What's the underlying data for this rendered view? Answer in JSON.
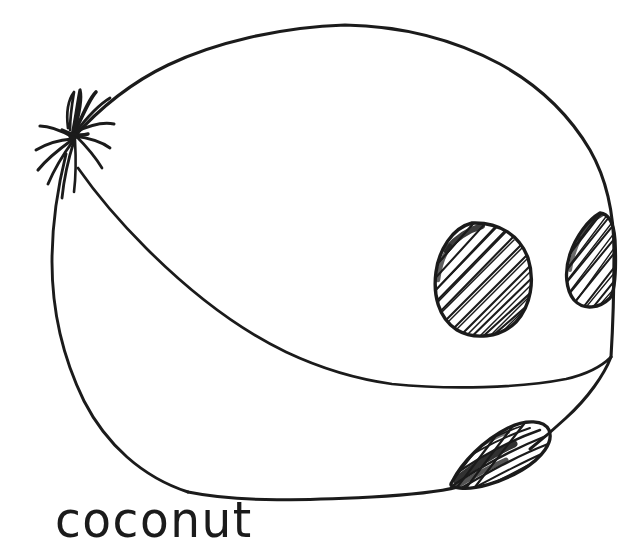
{
  "page": {
    "width": 623,
    "height": 550,
    "background_color": "#ffffff",
    "ink_color": "#1b1b1b",
    "style": "hand-drawn black ink line art on white background",
    "subject": "coconut"
  },
  "caption": {
    "text": "coconut",
    "position": "bottom-left",
    "case": "lowercase",
    "color": "#1b1b1b"
  },
  "drawing": {
    "title": "coconut",
    "description": "A hand-drawn ink sketch of a whole coconut seen from the side, with a fibrous tuft at the upper-left, a curving husk seam across the lower body, and three hatched germination eyes on the right side.",
    "parts": [
      {
        "name": "body-outline",
        "label": "coconut body",
        "shape": "large slightly-irregular oval",
        "bounds": {
          "x": 52,
          "y": 25,
          "width": 563,
          "height": 472
        }
      },
      {
        "name": "husk-tuft",
        "label": "fibrous tuft",
        "shape": "radiating spiky fibers",
        "bounds": {
          "x": 30,
          "y": 95,
          "width": 90,
          "height": 110
        },
        "fiber_count": 13
      },
      {
        "name": "husk-seam",
        "label": "husk seam curve",
        "shape": "sweeping curve from tuft down to right edge",
        "from": {
          "x": 78,
          "y": 168
        },
        "to": {
          "x": 611,
          "y": 357
        }
      },
      {
        "name": "eye-spot-1",
        "label": "coconut eye (large)",
        "shape": "rounded triangular blob with diagonal hatching",
        "bounds": {
          "x": 433,
          "y": 222,
          "width": 98,
          "height": 115
        },
        "hatch_angle_deg": 62,
        "hatch_lines": 26
      },
      {
        "name": "eye-spot-2",
        "label": "coconut eye (edge, clipped)",
        "shape": "lens shape cut by the right outline",
        "bounds": {
          "x": 566,
          "y": 212,
          "width": 50,
          "height": 96
        },
        "hatch_angle_deg": 72,
        "hatch_lines": 18
      },
      {
        "name": "eye-spot-3",
        "label": "coconut eye (lower, on edge)",
        "shape": "slanted oval straddling the bottom-right outline",
        "bounds": {
          "x": 447,
          "y": 419,
          "width": 103,
          "height": 68
        },
        "hatch_angle_deg": 28,
        "hatch_lines": 20
      }
    ]
  }
}
